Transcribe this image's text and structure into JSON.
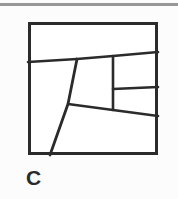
{
  "figure": {
    "caption": "C",
    "colors": {
      "background": "#fcfcfc",
      "ink": "#2b2b2b",
      "rule": "#8e8e8e"
    },
    "frame": {
      "x": 28,
      "y": 22,
      "width": 130,
      "height": 133,
      "stroke_width": 3
    },
    "top_rule": {
      "x": 0,
      "y": 5,
      "width": 178,
      "thickness": 3
    },
    "segments": [
      {
        "name": "upper-horizontal-divider",
        "points": "28,62 77,59 113,56 158,52",
        "stroke_width": 2.6
      },
      {
        "name": "main-diagonal-divider",
        "points": "77,59 68,104 50,155",
        "stroke_width": 2.8
      },
      {
        "name": "lower-horizontal-divider",
        "points": "68,104 113,110 158,116",
        "stroke_width": 2.6
      },
      {
        "name": "right-vertical-divider",
        "points": "113,56 113,110",
        "stroke_width": 2.6
      },
      {
        "name": "right-short-horizontal-divider",
        "points": "113,89 158,87",
        "stroke_width": 2.6
      }
    ]
  }
}
